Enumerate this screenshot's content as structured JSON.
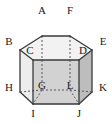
{
  "figure": {
    "kind": "hexagonal-prism-diagram",
    "colors": {
      "outline": "#3a3a3a",
      "hidden_edge": "#5a5a5a",
      "top_face": "#f2f2f2",
      "left_face": "#ededed",
      "front_left_face": "#dcdcdc",
      "front_face": "#d2d2d2",
      "front_right_face": "#c9c9c9",
      "right_face": "#bdbdbd",
      "label_text": "#1a1a1a",
      "background": "#ffffff"
    },
    "vertices": [
      {
        "label": "A",
        "x": 42,
        "y": 36,
        "lx": 42,
        "ly": 10,
        "hidden": false
      },
      {
        "label": "F",
        "x": 70,
        "y": 36,
        "lx": 70,
        "ly": 10,
        "hidden": false
      },
      {
        "label": "B",
        "x": 20,
        "y": 50,
        "lx": 9,
        "ly": 41,
        "hidden": false
      },
      {
        "label": "E",
        "x": 92,
        "y": 50,
        "lx": 103,
        "ly": 41,
        "hidden": false
      },
      {
        "label": "C",
        "x": 33,
        "y": 60,
        "lx": 30,
        "ly": 50,
        "hidden": false
      },
      {
        "label": "D",
        "x": 79,
        "y": 60,
        "lx": 82,
        "ly": 50,
        "hidden": false
      },
      {
        "label": "G",
        "x": 42,
        "y": 90,
        "lx": 42,
        "ly": 85,
        "hidden": true
      },
      {
        "label": "L",
        "x": 70,
        "y": 90,
        "lx": 70,
        "ly": 85,
        "hidden": true
      },
      {
        "label": "H",
        "x": 20,
        "y": 92,
        "lx": 9,
        "ly": 87,
        "hidden": false
      },
      {
        "label": "K",
        "x": 92,
        "y": 92,
        "lx": 103,
        "ly": 87,
        "hidden": false
      },
      {
        "label": "I",
        "x": 33,
        "y": 104,
        "lx": 33,
        "ly": 109,
        "hidden": false
      },
      {
        "label": "J",
        "x": 79,
        "y": 104,
        "lx": 79,
        "ly": 109,
        "hidden": false
      }
    ],
    "solid_edges": [
      "A-F",
      "A-B",
      "F-E",
      "B-C",
      "E-D",
      "C-D",
      "B-H",
      "E-K",
      "C-I",
      "D-J",
      "H-I",
      "K-J",
      "I-J"
    ],
    "hidden_edges": [
      "A-G",
      "F-L",
      "G-L",
      "G-H",
      "L-K",
      "G-C",
      "L-D"
    ]
  }
}
